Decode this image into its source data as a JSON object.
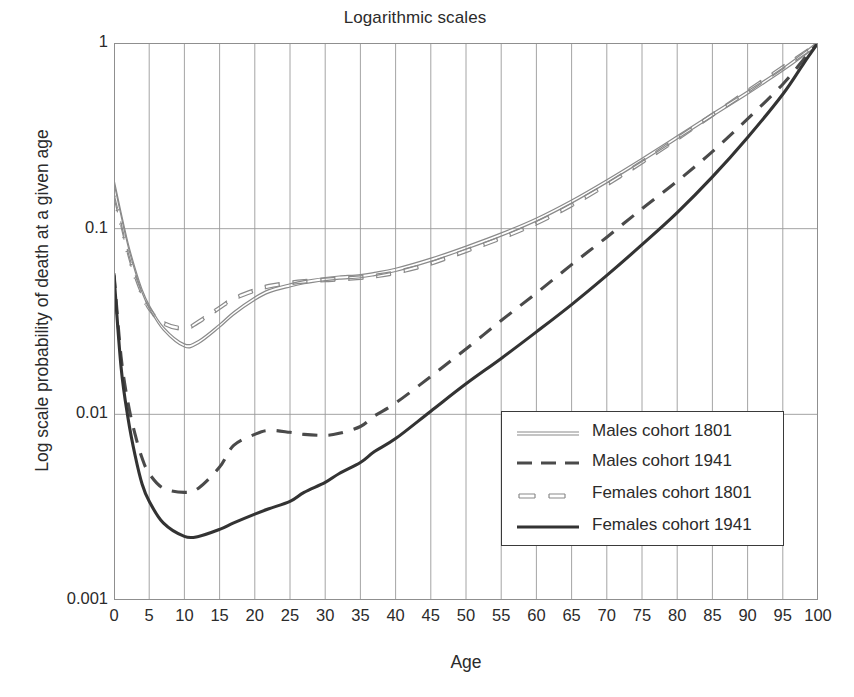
{
  "chart_data": {
    "type": "line",
    "title": "Logarithmic scales",
    "xlabel": "Age",
    "ylabel": "Log scale probability of death at a given age",
    "yscale": "log",
    "ylim": [
      0.001,
      1
    ],
    "xlim": [
      0,
      100
    ],
    "grid": true,
    "legend_position": "lower right inside plot",
    "ytick_labels": [
      "1",
      "0.1",
      "0.01",
      "0.001"
    ],
    "ytick_values": [
      1,
      0.1,
      0.01,
      0.001
    ],
    "xtick_labels": [
      "0",
      "5",
      "10",
      "15",
      "20",
      "25",
      "30",
      "35",
      "40",
      "45",
      "50",
      "55",
      "60",
      "65",
      "70",
      "75",
      "80",
      "85",
      "90",
      "95",
      "100"
    ],
    "x": [
      0,
      1,
      2,
      3,
      4,
      5,
      7,
      10,
      12,
      15,
      17,
      20,
      22,
      25,
      27,
      30,
      32,
      35,
      37,
      40,
      45,
      50,
      55,
      60,
      65,
      70,
      75,
      80,
      85,
      90,
      95,
      98,
      100
    ],
    "series": [
      {
        "name": "Males cohort 1801",
        "style": "solid-thin-double",
        "color": "#8a8a8a",
        "values": [
          0.18,
          0.12,
          0.082,
          0.06,
          0.046,
          0.038,
          0.029,
          0.0235,
          0.0245,
          0.03,
          0.035,
          0.042,
          0.046,
          0.0495,
          0.0515,
          0.0535,
          0.0545,
          0.0555,
          0.057,
          0.06,
          0.068,
          0.079,
          0.093,
          0.112,
          0.14,
          0.18,
          0.235,
          0.31,
          0.41,
          0.54,
          0.72,
          0.87,
          1.0
        ]
      },
      {
        "name": "Males cohort 1941",
        "style": "dashed-thick",
        "color": "#4a4a4a",
        "values": [
          0.0575,
          0.0205,
          0.0115,
          0.0078,
          0.0058,
          0.0048,
          0.004,
          0.0038,
          0.004,
          0.0052,
          0.0068,
          0.0078,
          0.0082,
          0.008,
          0.0078,
          0.0077,
          0.0079,
          0.0086,
          0.0098,
          0.0115,
          0.016,
          0.0225,
          0.032,
          0.045,
          0.064,
          0.09,
          0.128,
          0.18,
          0.26,
          0.39,
          0.6,
          0.82,
          1.0
        ]
      },
      {
        "name": "Females cohort 1801",
        "style": "dashed-thin",
        "color": "#8a8a8a",
        "values": [
          0.15,
          0.105,
          0.073,
          0.055,
          0.044,
          0.037,
          0.031,
          0.029,
          0.0315,
          0.0375,
          0.042,
          0.0465,
          0.049,
          0.051,
          0.052,
          0.053,
          0.0535,
          0.0545,
          0.0555,
          0.058,
          0.065,
          0.076,
          0.089,
          0.107,
          0.134,
          0.173,
          0.228,
          0.305,
          0.41,
          0.55,
          0.74,
          0.88,
          1.0
        ]
      },
      {
        "name": "Females cohort 1941",
        "style": "solid-thick",
        "color": "#333333",
        "values": [
          0.056,
          0.018,
          0.0095,
          0.006,
          0.0042,
          0.0034,
          0.0026,
          0.0022,
          0.0022,
          0.0024,
          0.0026,
          0.0029,
          0.0031,
          0.0034,
          0.0038,
          0.0043,
          0.0048,
          0.0055,
          0.0063,
          0.0074,
          0.0104,
          0.0146,
          0.02,
          0.0278,
          0.039,
          0.056,
          0.082,
          0.122,
          0.19,
          0.31,
          0.53,
          0.78,
          1.0
        ]
      }
    ]
  },
  "legend": {
    "items": [
      {
        "label": "Males cohort 1801"
      },
      {
        "label": "Males cohort 1941"
      },
      {
        "label": "Females cohort 1801"
      },
      {
        "label": "Females cohort 1941"
      }
    ]
  }
}
